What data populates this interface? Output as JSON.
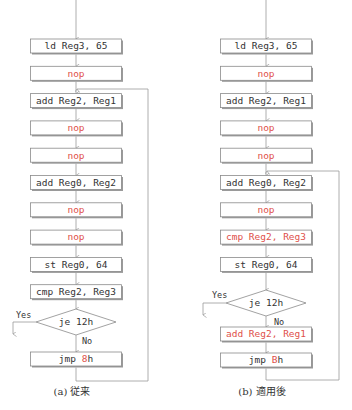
{
  "colors": {
    "normal_text": "#333333",
    "highlight_text": "#e0504a",
    "line": "#9a9a9a"
  },
  "left": {
    "caption": "(a) 従来",
    "boxes": [
      {
        "text": "ld Reg3, 65",
        "highlight": false
      },
      {
        "text": "nop",
        "highlight": true
      },
      {
        "text": "add Reg2, Reg1",
        "highlight": false
      },
      {
        "text": "nop",
        "highlight": true
      },
      {
        "text": "nop",
        "highlight": true
      },
      {
        "text": "add Reg0, Reg2",
        "highlight": false
      },
      {
        "text": "nop",
        "highlight": true
      },
      {
        "text": "nop",
        "highlight": true
      },
      {
        "text": "st Reg0, 64",
        "highlight": false
      },
      {
        "text": "cmp Reg2, Reg3",
        "highlight": false
      }
    ],
    "decision": {
      "text": "je 12h",
      "yes_label": "Yes",
      "no_label": "No"
    },
    "jump": {
      "prefix": "jmp ",
      "target": "8",
      "suffix": "h"
    }
  },
  "right": {
    "caption": "(b) 適用後",
    "boxes": [
      {
        "text": "ld Reg3, 65",
        "highlight": false
      },
      {
        "text": "nop",
        "highlight": true
      },
      {
        "text": "add Reg2, Reg1",
        "highlight": false
      },
      {
        "text": "nop",
        "highlight": true
      },
      {
        "text": "nop",
        "highlight": true
      },
      {
        "text": "add Reg0, Reg2",
        "highlight": false
      },
      {
        "text": "nop",
        "highlight": true
      },
      {
        "text": "cmp Reg2, Reg3",
        "highlight": true
      },
      {
        "text": "st Reg0, 64",
        "highlight": false
      }
    ],
    "decision": {
      "text": "je 12h",
      "yes_label": "Yes",
      "no_label": "No"
    },
    "after_decision_box": {
      "text": "add Reg2, Reg1",
      "highlight": true
    },
    "jump": {
      "prefix": "jmp ",
      "target": "B",
      "suffix": "h"
    }
  }
}
